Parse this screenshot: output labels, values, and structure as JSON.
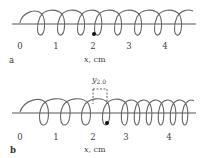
{
  "figure": {
    "type": "longitudinal wave on a coiled spring",
    "panels": [
      {
        "id": "a",
        "label": "a",
        "axis": {
          "ticks": [
            "0",
            "1",
            "2",
            "3",
            "4"
          ],
          "label_var": "x",
          "label_unit": ", cm"
        },
        "coils": "evenly spaced",
        "marker": "dot on coil at x = 2.0 cm"
      },
      {
        "id": "b",
        "label": "b",
        "axis": {
          "ticks": [
            "0",
            "1",
            "2",
            "3",
            "4"
          ],
          "label_var": "x",
          "label_unit": ", cm"
        },
        "coils": "compressed near x = 3–4 cm, stretched near x = 0–2 cm",
        "marker": "dot on coil displaced right of x = 2.0 cm",
        "displacement": {
          "symbol": "y",
          "subscript": "2.0"
        }
      }
    ],
    "colors": {
      "line": "#555555",
      "coil": "#666666",
      "marker": "#111111",
      "background": "#ffffff"
    }
  }
}
